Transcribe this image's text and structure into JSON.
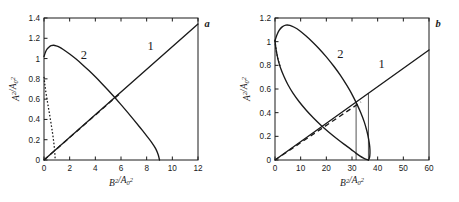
{
  "figure": {
    "background": "#ffffff",
    "ink_color": "#1a1a1a",
    "panel_a_letter": "a",
    "panel_b_letter": "b"
  },
  "chart_data": [
    {
      "type": "line",
      "panel": "a",
      "title": "a",
      "xlabel": "B²/A₀²",
      "ylabel": "A²/A₀²",
      "xlim": [
        0,
        12
      ],
      "ylim": [
        0,
        1.4
      ],
      "xticks": [
        0,
        2,
        4,
        6,
        8,
        10,
        12
      ],
      "xticklabels": [
        "0",
        "2",
        "4",
        "6",
        "8",
        "10",
        "12"
      ],
      "yticks": [
        0,
        0.2,
        0.4,
        0.6,
        0.8,
        1,
        1.2,
        1.4
      ],
      "yticklabels": [
        "0",
        "0.2",
        "0.4",
        "0.6",
        "0.8",
        "1",
        "1.2",
        "1.4"
      ],
      "grid": false,
      "legend": "inline-curve-numbers",
      "annotations": [
        {
          "text": "1",
          "x": 8.3,
          "y": 1.08
        },
        {
          "text": "2",
          "x": 3.1,
          "y": 1.0
        }
      ],
      "series": [
        {
          "name": "1",
          "style": "solid",
          "points": [
            [
              0,
              0
            ],
            [
              12,
              1.34
            ]
          ]
        },
        {
          "name": "2-upper",
          "style": "solid",
          "points": [
            [
              0.0,
              1.02
            ],
            [
              0.12,
              1.065
            ],
            [
              0.25,
              1.095
            ],
            [
              0.4,
              1.115
            ],
            [
              0.55,
              1.127
            ],
            [
              0.75,
              1.131
            ],
            [
              0.95,
              1.126
            ],
            [
              1.2,
              1.113
            ],
            [
              1.5,
              1.09
            ],
            [
              2.0,
              1.045
            ],
            [
              2.5,
              0.995
            ],
            [
              3.0,
              0.94
            ],
            [
              3.5,
              0.882
            ],
            [
              4.0,
              0.82
            ],
            [
              4.5,
              0.755
            ],
            [
              5.0,
              0.688
            ],
            [
              5.5,
              0.618
            ],
            [
              6.0,
              0.546
            ],
            [
              6.5,
              0.472
            ],
            [
              7.0,
              0.396
            ],
            [
              7.5,
              0.318
            ],
            [
              8.0,
              0.238
            ],
            [
              8.4,
              0.172
            ],
            [
              8.7,
              0.112
            ],
            [
              8.9,
              0.052
            ],
            [
              9.0,
              0.0
            ]
          ]
        },
        {
          "name": "2-lower",
          "style": "dotted",
          "points": [
            [
              0.0,
              0.82
            ],
            [
              0.05,
              0.76
            ],
            [
              0.1,
              0.71
            ],
            [
              0.18,
              0.64
            ],
            [
              0.28,
              0.565
            ],
            [
              0.38,
              0.49
            ],
            [
              0.48,
              0.415
            ],
            [
              0.58,
              0.335
            ],
            [
              0.66,
              0.27
            ],
            [
              0.73,
              0.205
            ],
            [
              0.79,
              0.14
            ],
            [
              0.83,
              0.085
            ],
            [
              0.86,
              0.03
            ],
            [
              0.87,
              0.0
            ]
          ]
        },
        {
          "name": "dashed-line",
          "style": "dashed",
          "points": [
            [
              0,
              0
            ],
            [
              6.0,
              0.665
            ]
          ]
        }
      ]
    },
    {
      "type": "line",
      "panel": "b",
      "title": "b",
      "xlabel": "B²/A₀²",
      "ylabel": "A²/A₀²",
      "xlim": [
        0,
        60
      ],
      "ylim": [
        0,
        1.2
      ],
      "xticks": [
        0,
        10,
        20,
        30,
        40,
        50,
        60
      ],
      "xticklabels": [
        "0",
        "10",
        "20",
        "30",
        "40",
        "50",
        "60"
      ],
      "yticks": [
        0,
        0.2,
        0.4,
        0.6,
        0.8,
        1,
        1.2
      ],
      "yticklabels": [
        "0",
        "0.2",
        "0.4",
        "0.6",
        "0.8",
        "1",
        "1.2"
      ],
      "grid": false,
      "legend": "inline-curve-numbers",
      "annotations": [
        {
          "text": "1",
          "x": 41.5,
          "y": 0.78
        },
        {
          "text": "2",
          "x": 25.5,
          "y": 0.86
        }
      ],
      "series": [
        {
          "name": "1",
          "style": "solid",
          "points": [
            [
              0,
              0
            ],
            [
              60,
              0.93
            ]
          ]
        },
        {
          "name": "2-upper",
          "style": "solid",
          "points": [
            [
              0.0,
              1.01
            ],
            [
              0.7,
              1.055
            ],
            [
              1.6,
              1.095
            ],
            [
              2.8,
              1.125
            ],
            [
              4.2,
              1.14
            ],
            [
              5.8,
              1.138
            ],
            [
              7.5,
              1.122
            ],
            [
              9.5,
              1.095
            ],
            [
              12.0,
              1.05
            ],
            [
              14.5,
              1.0
            ],
            [
              17.0,
              0.945
            ],
            [
              20.0,
              0.872
            ],
            [
              23.0,
              0.79
            ],
            [
              25.5,
              0.715
            ],
            [
              28.0,
              0.63
            ],
            [
              30.0,
              0.555
            ],
            [
              32.0,
              0.468
            ],
            [
              33.5,
              0.395
            ],
            [
              34.8,
              0.32
            ],
            [
              35.8,
              0.245
            ],
            [
              36.5,
              0.175
            ],
            [
              36.9,
              0.115
            ],
            [
              37.0,
              0.06
            ],
            [
              36.8,
              0.018
            ],
            [
              36.4,
              0.0
            ]
          ]
        },
        {
          "name": "2-lower",
          "style": "solid",
          "points": [
            [
              0.0,
              1.01
            ],
            [
              0.3,
              0.95
            ],
            [
              0.7,
              0.9
            ],
            [
              1.3,
              0.84
            ],
            [
              2.2,
              0.775
            ],
            [
              3.5,
              0.705
            ],
            [
              5.0,
              0.638
            ],
            [
              7.0,
              0.565
            ],
            [
              9.5,
              0.49
            ],
            [
              12.0,
              0.425
            ],
            [
              15.0,
              0.355
            ],
            [
              18.0,
              0.292
            ],
            [
              21.0,
              0.235
            ],
            [
              24.0,
              0.182
            ],
            [
              27.0,
              0.132
            ],
            [
              29.5,
              0.092
            ],
            [
              31.5,
              0.058
            ],
            [
              33.0,
              0.035
            ],
            [
              34.5,
              0.016
            ],
            [
              35.6,
              0.005
            ],
            [
              36.4,
              0.0
            ]
          ]
        },
        {
          "name": "2-lower-tail-dotted",
          "style": "dotted",
          "points": [
            [
              0.0,
              1.01
            ],
            [
              0.2,
              0.97
            ],
            [
              0.5,
              0.925
            ],
            [
              0.9,
              0.878
            ],
            [
              1.4,
              0.835
            ],
            [
              2.0,
              0.795
            ]
          ]
        },
        {
          "name": "dashed-line",
          "style": "dashed",
          "points": [
            [
              0,
              0
            ],
            [
              33.5,
              0.49
            ]
          ]
        }
      ],
      "vertical_markers": [
        {
          "x": 31.6,
          "y_from": 0,
          "y_to": 0.478
        },
        {
          "x": 36.4,
          "y_from": 0,
          "y_to": 0.565
        }
      ]
    }
  ]
}
